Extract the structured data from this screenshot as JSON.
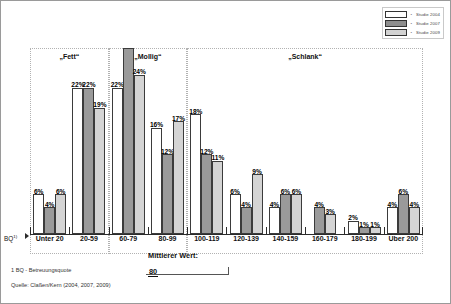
{
  "legend": {
    "bullet": "•",
    "entries": [
      {
        "label": "Studie 2004",
        "color": "#ffffff",
        "key": "2004"
      },
      {
        "label": "Studie 2007",
        "color": "#8e8e8e",
        "key": "2007"
      },
      {
        "label": "Studie 2009",
        "color": "#d2d2d2",
        "key": "2009"
      }
    ]
  },
  "bands": [
    {
      "title": "„Fett“"
    },
    {
      "title": "„Mollig“"
    },
    {
      "title": "„Schlank“"
    }
  ],
  "axis": {
    "name": "BQ",
    "name_sup": "1)"
  },
  "annotation": {
    "title": "Mittlerer Wert:",
    "value": "80"
  },
  "footnote": "1  BQ - Betreuungsquote",
  "source": "Quelle: Claßen/Kern (2004, 2007, 2009)",
  "chart_data": {
    "type": "bar",
    "title": "",
    "xlabel": "BQ",
    "ylabel": "",
    "ylim": [
      0,
      28
    ],
    "grid": false,
    "legend_position": "top-right",
    "value_suffix": "%",
    "categories": [
      "Unter 20",
      "20-59",
      "60-79",
      "80-99",
      "100-119",
      "120-139",
      "140-159",
      "160-179",
      "180-199",
      "Über 200"
    ],
    "category_bands": [
      {
        "label": "„Fett“",
        "categories": [
          "Unter 20",
          "20-59"
        ]
      },
      {
        "label": "„Mollig“",
        "categories": [
          "60-79",
          "80-99"
        ]
      },
      {
        "label": "„Schlank“",
        "categories": [
          "100-119",
          "120-139",
          "140-159",
          "160-179",
          "180-199",
          "Über 200"
        ]
      }
    ],
    "series": [
      {
        "name": "Studie 2004",
        "values": [
          6,
          22,
          22,
          16,
          18,
          6,
          4,
          null,
          2,
          4
        ],
        "labels": [
          "6%",
          "22%",
          "22%",
          "16%",
          "18%",
          "6%",
          "4%",
          "",
          "2%",
          "4%"
        ]
      },
      {
        "name": "Studie 2007",
        "values": [
          4,
          22,
          28,
          12,
          12,
          4,
          6,
          4,
          1,
          6
        ],
        "labels": [
          "4%",
          "22%",
          "",
          "12%",
          "12%",
          "4%",
          "6%",
          "4%",
          "1%",
          "6%"
        ]
      },
      {
        "name": "Studie 2009",
        "values": [
          6,
          19,
          24,
          17,
          11,
          9,
          6,
          3,
          1,
          4
        ],
        "labels": [
          "6%",
          "19%",
          "24%",
          "17%",
          "11%",
          "9%",
          "6%",
          "3%",
          "1%",
          "4%"
        ]
      }
    ],
    "annotations": [
      {
        "text": "Mittlerer Wert: 80",
        "at": "80-99 / 100-119 boundary"
      }
    ]
  }
}
